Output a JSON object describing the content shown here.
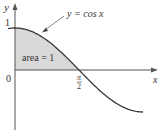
{
  "chart_data": {
    "type": "area",
    "title": "",
    "function": "y = cos x",
    "curve_label": "y = cos x",
    "xlabel": "x",
    "ylabel": "y",
    "x_range": [
      -0.17,
      3.2
    ],
    "y_range": [
      -1.0,
      1.0
    ],
    "ticks": {
      "x": [
        {
          "value": 0,
          "label": "0"
        },
        {
          "value": 1.5708,
          "label": "π/2"
        }
      ],
      "y": [
        {
          "value": 1,
          "label": "1"
        }
      ]
    },
    "shaded_region": {
      "from": 0,
      "to": 1.5708,
      "label": "area = 1"
    },
    "x": [
      -0.17,
      0,
      0.25,
      0.5,
      0.75,
      1.0,
      1.25,
      1.5708,
      2.0,
      2.5,
      3.14
    ],
    "values": [
      0.986,
      1.0,
      0.969,
      0.878,
      0.732,
      0.54,
      0.315,
      0.0,
      -0.416,
      -0.801,
      -1.0
    ],
    "grid": false,
    "legend": null
  },
  "labels": {
    "y_axis": "y",
    "x_axis": "x",
    "origin": "0",
    "y_one": "1",
    "pi": "π",
    "two": "2",
    "curve": "y = cos x",
    "area": "area = 1"
  },
  "colors": {
    "line": "#3a3a3a",
    "fill": "#d9d9d9",
    "axis": "#555555"
  }
}
